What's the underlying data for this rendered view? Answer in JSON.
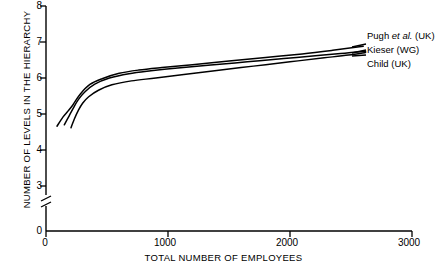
{
  "chart_data": {
    "type": "line",
    "title": "",
    "xlabel": "TOTAL NUMBER OF EMPLOYEES",
    "ylabel": "NUMBER OF LEVELS IN THE HIERARCHY",
    "xlim": [
      0,
      3000
    ],
    "ylim": [
      0,
      8
    ],
    "y_axis_break": {
      "between": [
        0,
        3
      ],
      "present": true
    },
    "xticks": [
      0,
      1000,
      2000,
      3000
    ],
    "xtick_labels": [
      "0",
      "1000",
      "2000",
      "3000"
    ],
    "yticks": [
      0,
      3,
      4,
      5,
      6,
      7,
      8
    ],
    "ytick_labels": [
      "0",
      "3",
      "4",
      "5",
      "6",
      "7",
      "8"
    ],
    "grid": false,
    "legend_position": "right-inside-top",
    "line_color": "#000000",
    "series": [
      {
        "name": "Pugh et al. (UK)",
        "name_parts": {
          "lead": "Pugh ",
          "italic": "et al.",
          "tail": " (UK)"
        },
        "x": [
          90,
          140,
          180,
          220,
          280,
          360,
          460,
          600,
          760,
          950,
          1200,
          1500,
          1800,
          2100,
          2350,
          2600
        ],
        "y": [
          4.66,
          4.92,
          5.08,
          5.25,
          5.55,
          5.82,
          5.98,
          6.13,
          6.22,
          6.29,
          6.37,
          6.47,
          6.57,
          6.67,
          6.77,
          6.88
        ]
      },
      {
        "name": "Kieser (WG)",
        "name_parts": {
          "lead": "Kieser (WG)",
          "italic": "",
          "tail": ""
        },
        "x": [
          150,
          190,
          225,
          265,
          320,
          400,
          520,
          680,
          860,
          1080,
          1350,
          1650,
          1950,
          2250,
          2450,
          2620
        ],
        "y": [
          4.7,
          4.95,
          5.17,
          5.4,
          5.62,
          5.83,
          6.0,
          6.12,
          6.2,
          6.28,
          6.36,
          6.45,
          6.54,
          6.63,
          6.69,
          6.74
        ]
      },
      {
        "name": "Child (UK)",
        "name_parts": {
          "lead": "Child (UK)",
          "italic": "",
          "tail": ""
        },
        "x": [
          205,
          235,
          265,
          300,
          350,
          430,
          540,
          700,
          900,
          1130,
          1400,
          1700,
          2000,
          2280,
          2480,
          2620
        ],
        "y": [
          4.62,
          4.88,
          5.1,
          5.3,
          5.48,
          5.66,
          5.81,
          5.92,
          6.0,
          6.1,
          6.21,
          6.33,
          6.45,
          6.56,
          6.64,
          6.71
        ]
      }
    ],
    "annotations": [
      {
        "text": "Pugh et al. (UK)",
        "x": 2700,
        "y": 6.95
      },
      {
        "text": "Kieser (WG)",
        "x": 2700,
        "y": 6.68
      },
      {
        "text": "Child (UK)",
        "x": 2700,
        "y": 6.4
      }
    ]
  }
}
